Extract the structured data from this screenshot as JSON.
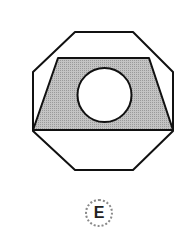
{
  "figure": {
    "shapes": [
      "octagon",
      "trapezoid",
      "circle"
    ],
    "colors": {
      "stroke": "#111111",
      "shade": "#b5b5b5",
      "background": "#ffffff"
    }
  },
  "option": {
    "label": "E"
  }
}
